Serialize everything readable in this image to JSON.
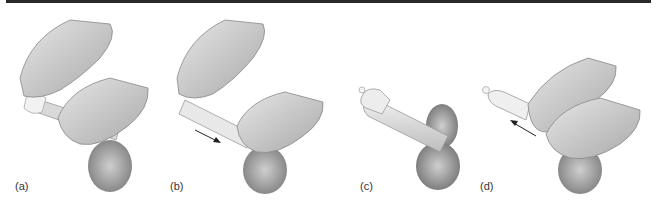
{
  "figure": {
    "top_bar_color": "#2a2a2a",
    "panels": [
      {
        "label": "(a)",
        "description": "hands placing condom on tip"
      },
      {
        "label": "(b)",
        "description": "unrolling condom down shaft",
        "arrow": "down-right"
      },
      {
        "label": "(c)",
        "description": "condom fully on"
      },
      {
        "label": "(d)",
        "description": "holding base while withdrawing",
        "arrow": "up-left"
      }
    ]
  }
}
